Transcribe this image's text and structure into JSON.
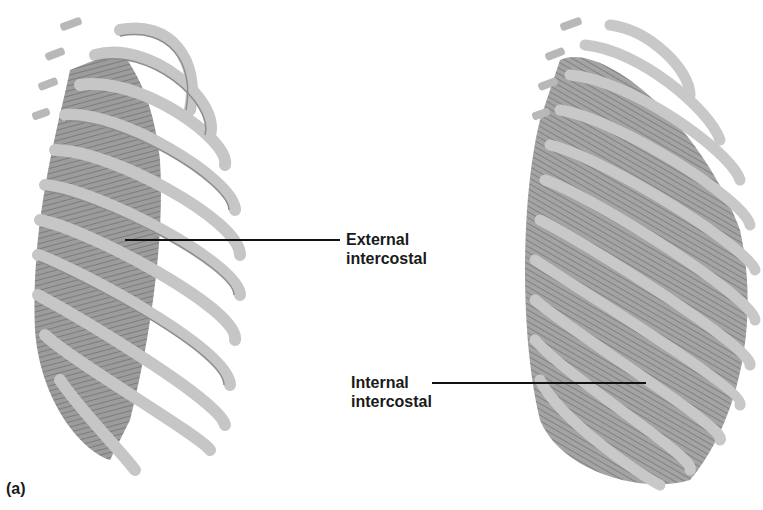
{
  "figure": {
    "panel_label": "(a)",
    "left_illustration": {
      "subject": "rib cage with external intercostal muscles",
      "label_line1": "External",
      "label_line2": "intercostal"
    },
    "right_illustration": {
      "subject": "rib cage with internal intercostal muscles",
      "label_line1": "Internal",
      "label_line2": "intercostal"
    },
    "colors": {
      "bone": "#c9c9c9",
      "bone_shadow": "#9a9a9a",
      "muscle": "#8a8a8a",
      "leader_line": "#111111",
      "text": "#1a1a1a"
    }
  }
}
